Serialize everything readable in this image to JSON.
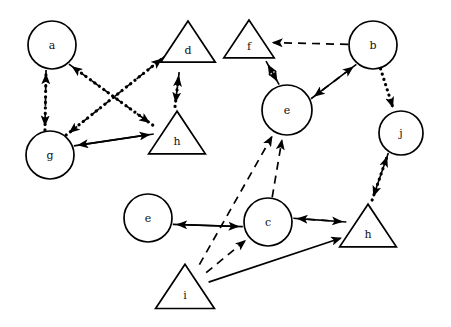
{
  "diagram": {
    "background": "#ffffff",
    "stroke_color": "#000000",
    "width": 451,
    "height": 327,
    "nodes": [
      {
        "id": "n1",
        "label": "a",
        "shape": "circle",
        "x": 52,
        "y": 45,
        "r": 24
      },
      {
        "id": "n2",
        "label": "d",
        "shape": "triangle",
        "x": 188,
        "y": 45,
        "r": 26
      },
      {
        "id": "n3",
        "label": "f",
        "shape": "triangle",
        "x": 249,
        "y": 42,
        "r": 24
      },
      {
        "id": "n4",
        "label": "b",
        "shape": "circle",
        "x": 373,
        "y": 45,
        "r": 24
      },
      {
        "id": "n5",
        "label": "g",
        "shape": "circle",
        "x": 50,
        "y": 155,
        "r": 24
      },
      {
        "id": "n6",
        "label": "h",
        "shape": "triangle",
        "x": 177,
        "y": 136,
        "r": 27
      },
      {
        "id": "n7",
        "label": "e",
        "shape": "circle",
        "x": 287,
        "y": 110,
        "r": 25
      },
      {
        "id": "n8",
        "label": "j",
        "shape": "circle",
        "x": 401,
        "y": 133,
        "r": 22
      },
      {
        "id": "n9",
        "label": "e",
        "shape": "circle",
        "x": 148,
        "y": 218,
        "r": 24
      },
      {
        "id": "n10",
        "label": "c",
        "shape": "circle",
        "x": 268,
        "y": 222,
        "r": 24
      },
      {
        "id": "n11",
        "label": "h",
        "shape": "triangle",
        "x": 368,
        "y": 229,
        "r": 27
      },
      {
        "id": "n12",
        "label": "i",
        "shape": "triangle",
        "x": 185,
        "y": 290,
        "r": 28
      }
    ],
    "edges": [
      {
        "from": "n5",
        "to": "n1",
        "style": "dotted",
        "label": "g to a"
      },
      {
        "from": "n1",
        "to": "n5",
        "style": "dashed",
        "label": "a to g"
      },
      {
        "from": "n6",
        "to": "n1",
        "style": "dotted",
        "label": "h to a"
      },
      {
        "from": "n1",
        "to": "n6",
        "style": "dashed",
        "label": "a to h"
      },
      {
        "from": "n5",
        "to": "n2",
        "style": "dotted",
        "label": "g to d"
      },
      {
        "from": "n2",
        "to": "n5",
        "style": "dashed",
        "label": "d to g"
      },
      {
        "from": "n6",
        "to": "n2",
        "style": "dotted",
        "label": "h to d"
      },
      {
        "from": "n2",
        "to": "n6",
        "style": "dashed",
        "label": "d to h"
      },
      {
        "from": "n5",
        "to": "n6",
        "style": "solid",
        "label": "g to h"
      },
      {
        "from": "n6",
        "to": "n5",
        "style": "solid",
        "label": "h to g"
      },
      {
        "from": "n4",
        "to": "n3",
        "style": "dashed",
        "label": "b to f"
      },
      {
        "from": "n3",
        "to": "n7",
        "style": "solid",
        "label": "f to e"
      },
      {
        "from": "n7",
        "to": "n3",
        "style": "solid",
        "label": "e to f"
      },
      {
        "from": "n4",
        "to": "n7",
        "style": "solid",
        "label": "b to e"
      },
      {
        "from": "n7",
        "to": "n4",
        "style": "dashed",
        "label": "e to b"
      },
      {
        "from": "n4",
        "to": "n8",
        "style": "dotted",
        "label": "b to j"
      },
      {
        "from": "n11",
        "to": "n8",
        "style": "dotted",
        "label": "h to j"
      },
      {
        "from": "n8",
        "to": "n11",
        "style": "solid",
        "label": "j to h"
      },
      {
        "from": "n10",
        "to": "n9",
        "style": "solid",
        "label": "c to e"
      },
      {
        "from": "n9",
        "to": "n10",
        "style": "solid",
        "label": "e to c"
      },
      {
        "from": "n10",
        "to": "n11",
        "style": "dashed",
        "label": "c to h"
      },
      {
        "from": "n11",
        "to": "n10",
        "style": "solid",
        "label": "h to c"
      },
      {
        "from": "n12",
        "to": "n10",
        "style": "dashed",
        "label": "i to c"
      },
      {
        "from": "n12",
        "to": "n7",
        "style": "dashed",
        "label": "i to e"
      },
      {
        "from": "n12",
        "to": "n11",
        "style": "solid",
        "label": "i to h"
      },
      {
        "from": "n10",
        "to": "n7",
        "style": "dashed",
        "label": "c to e top"
      }
    ]
  }
}
